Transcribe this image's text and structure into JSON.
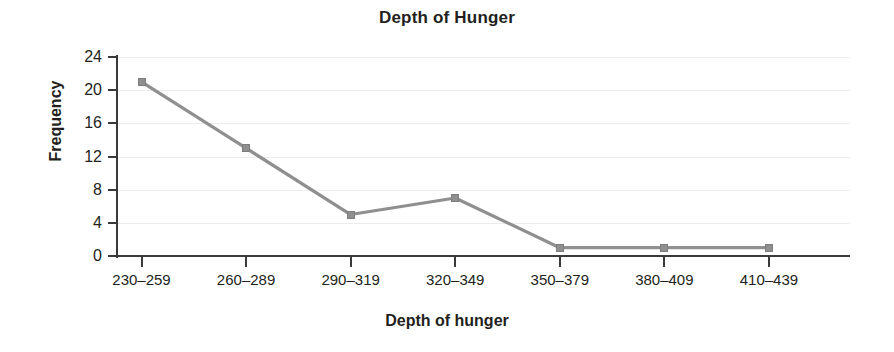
{
  "chart_data": {
    "type": "line",
    "title": "Depth of Hunger",
    "xlabel": "Depth of hunger",
    "ylabel": "Frequency",
    "categories": [
      "230–259",
      "260–289",
      "290–319",
      "320–349",
      "350–379",
      "380–409",
      "410–439"
    ],
    "values": [
      21,
      13,
      5,
      7,
      1,
      1,
      1
    ],
    "series": [
      {
        "name": "Frequency",
        "values": [
          21,
          13,
          5,
          7,
          1,
          1,
          1
        ],
        "color": "#8f8f8f",
        "marker": "square"
      }
    ],
    "ylim": [
      0,
      24
    ],
    "yticks": [
      0,
      4,
      8,
      12,
      16,
      20,
      24
    ],
    "ytick_labels": [
      "0",
      "4",
      "8",
      "12",
      "16",
      "20",
      "24"
    ],
    "grid": true,
    "grid_axis": "y",
    "legend": false,
    "legend_position": "none",
    "colors": {
      "line": "#8f8f8f",
      "marker": "#8f8f8f",
      "axis": "#3a3a3a",
      "grid": "#ededed",
      "text": "#231f20",
      "background": "#ffffff"
    }
  }
}
